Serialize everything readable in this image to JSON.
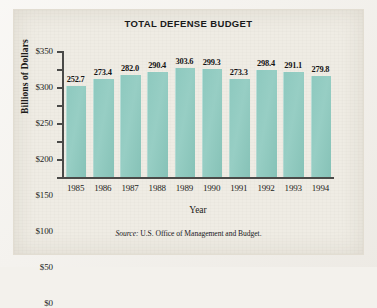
{
  "figure": {
    "background_color": "#efece4",
    "bar_color": "#8ec9bf",
    "axis_color": "#4a4a48"
  },
  "source": {
    "label": "Source:",
    "text": "U.S. Office of Management and Budget."
  },
  "chart_data": {
    "type": "bar",
    "title": "TOTAL DEFENSE BUDGET",
    "xlabel": "Year",
    "ylabel": "Billions of Dollars",
    "categories": [
      "1985",
      "1986",
      "1987",
      "1988",
      "1989",
      "1990",
      "1991",
      "1992",
      "1993",
      "1994"
    ],
    "values": [
      252.7,
      273.4,
      282.0,
      290.4,
      303.6,
      299.3,
      273.3,
      298.4,
      291.1,
      279.8
    ],
    "value_labels": [
      "252.7",
      "273.4",
      "282.0",
      "290.4",
      "303.6",
      "299.3",
      "273.3",
      "298.4",
      "291.1",
      "279.8"
    ],
    "ylim": [
      0,
      350
    ],
    "ytick_values": [
      0,
      50,
      100,
      150,
      200,
      250,
      300,
      350
    ],
    "ytick_labels": [
      "$0",
      "$50",
      "$100",
      "$150",
      "$200",
      "$250",
      "$300",
      "$350"
    ],
    "grid": false,
    "legend": null,
    "series": [
      {
        "name": "Total defense budget",
        "values": [
          252.7,
          273.4,
          282.0,
          290.4,
          303.6,
          299.3,
          273.3,
          298.4,
          291.1,
          279.8
        ]
      }
    ]
  }
}
